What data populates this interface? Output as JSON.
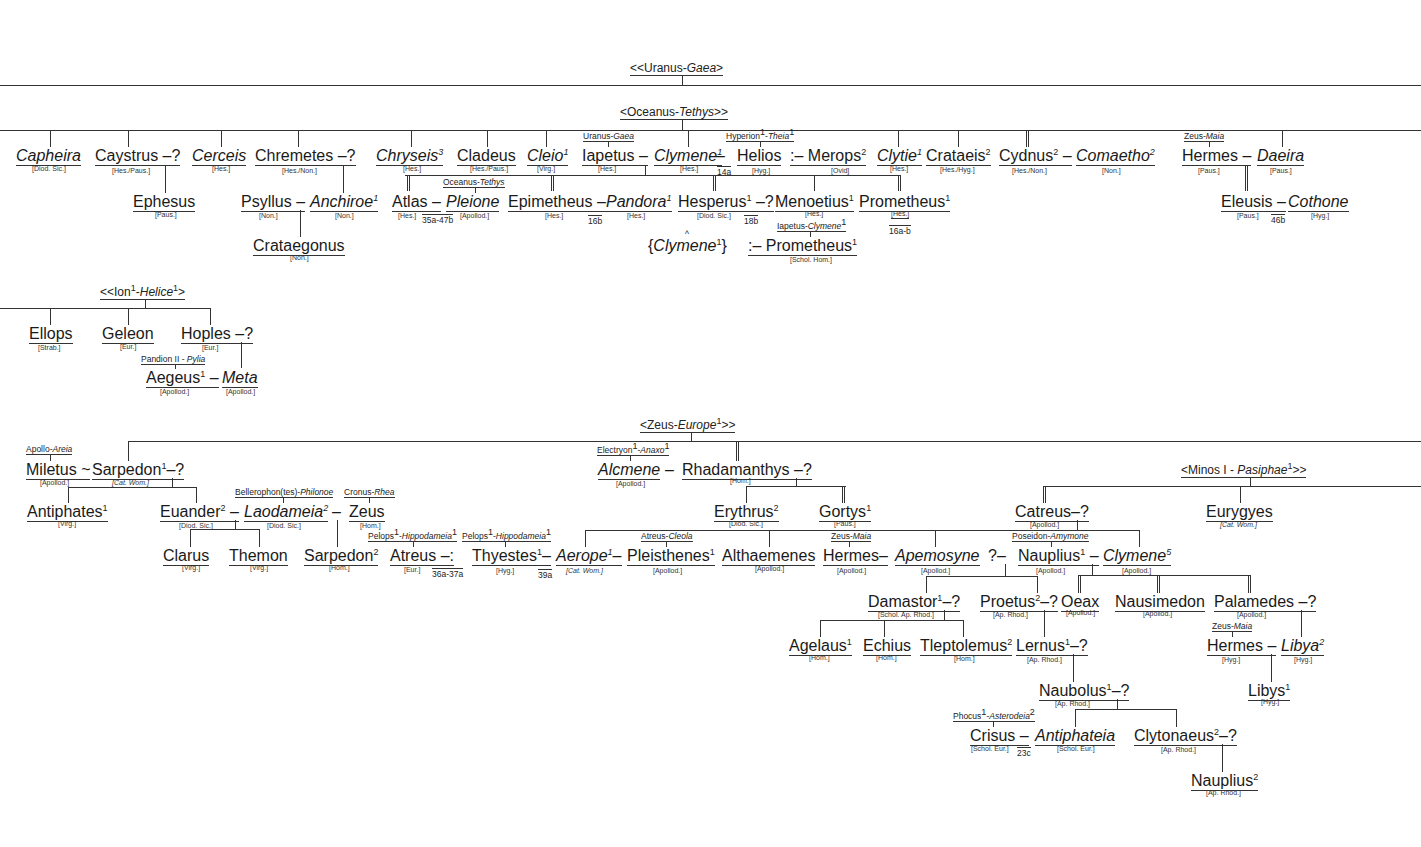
{
  "headers": {
    "uranus": {
      "pre": "<<Uranus-",
      "it": "Gaea",
      "post": ">"
    },
    "oceanus": {
      "pre": "<Oceanus-",
      "it": "Tethys",
      "post": ">>"
    },
    "ion": {
      "pre": "<<Ion",
      "sup1": "1",
      "mid": "-",
      "it": "Helice",
      "sup2": "1",
      "post": ">"
    },
    "zeus": {
      "pre": "<Zeus-",
      "it": "Europe",
      "sup": "1",
      "post": ">>"
    },
    "minos": {
      "pre": "<Minos I - ",
      "it": "Pasiphae",
      "sup": "1",
      "post": ">>"
    }
  },
  "row1": {
    "capheira": {
      "name": "Capheira",
      "src": "[Diod. Sic.]"
    },
    "caystrus": {
      "name": "Caystrus",
      "spouse": "–?",
      "src": "[Hes./Paus.]"
    },
    "cerceis": {
      "name": "Cerceis",
      "src": "[Hes.]"
    },
    "chremetes": {
      "name": "Chremetes",
      "spouse": "–?",
      "src": "[Hes./Non.]"
    },
    "chryseis": {
      "name": "Chryseis",
      "sup": "3",
      "src": "[Hes.]"
    },
    "cladeus": {
      "name": "Cladeus",
      "src": "[Hes./Paus.]"
    },
    "cleio": {
      "name": "Cleio",
      "sup": "1",
      "src": "[Virg.]"
    },
    "iapetus": {
      "parents": "Uranus-",
      "parents_it": "Gaea",
      "name": "Iapetus",
      "dash": "–",
      "src": "[Hes.]"
    },
    "clymene1": {
      "name": "Clymene",
      "sup": "1",
      "dash": "–",
      "src": "[Hes.]",
      "ref": "14a"
    },
    "helios": {
      "parents": "Hyperion",
      "parents_sup": "1",
      "parents_it": "Theia",
      "parents_it_sup": "1",
      "name": "Helios",
      "src": "[Hyg.]"
    },
    "merops": {
      "prefix": ":–",
      "name": "Merops",
      "sup": "2",
      "src": "[Ovid]"
    },
    "clytie": {
      "name": "Clytie",
      "sup": "1",
      "src": "[Hes.]"
    },
    "crataeis": {
      "name": "Crataeis",
      "sup": "2",
      "src": "[Hes./Hyg.]"
    },
    "cydnus": {
      "name": "Cydnus",
      "sup": "2",
      "dash": "–",
      "src": "[Hes./Non.]"
    },
    "comaetho": {
      "name": "Comaetho",
      "sup": "2",
      "src": "[Non.]"
    },
    "hermes": {
      "parents": "Zeus-",
      "parents_it": "Maia",
      "name": "Hermes",
      "dash": "–",
      "src": "[Paus.]"
    },
    "daeira": {
      "name": "Daeira",
      "src": "[Paus.]"
    }
  },
  "row2": {
    "ephesus": {
      "name": "Ephesus",
      "src": "[Paus.]"
    },
    "psyllus": {
      "name": "Psyllus",
      "dash": "–",
      "src": "[Non.]"
    },
    "anchiroe": {
      "name": "Anchiroe",
      "sup": "1",
      "src": "[Non.]"
    },
    "atlas": {
      "name": "Atlas",
      "dash": "–",
      "src": "[Hes.]",
      "ref": "35a-47b"
    },
    "pleione": {
      "parents": "Oceanus-",
      "parents_it": "Tethys",
      "name": "Pleione",
      "src": "[Apollod.]"
    },
    "epimetheus": {
      "name": "Epimetheus",
      "dash": "–",
      "src": "[Hes.]",
      "ref": "16b"
    },
    "pandora": {
      "name": "Pandora",
      "sup": "1",
      "src": "[Hes.]"
    },
    "hesperus": {
      "name": "Hesperus",
      "sup": "1",
      "spouse": "–?",
      "src": "[Diod. Sic.]",
      "ref": "18b"
    },
    "menoetius": {
      "name": "Menoetius",
      "sup": "1",
      "src": "[Hes.]"
    },
    "prometheus": {
      "name": "Prometheus",
      "sup": "1",
      "src": "[Hes.]",
      "ref": "16a-b"
    },
    "eleusis": {
      "name": "Eleusis",
      "dash": "–",
      "src": "[Paus.]",
      "ref": "46b"
    },
    "cothone": {
      "name": "Cothone",
      "src": "[Hyg.]"
    }
  },
  "row3": {
    "crataegonus": {
      "name": "Crataegonus",
      "src": "[Non.]"
    },
    "clymene_alt": {
      "open": "{",
      "name": "Clymene",
      "sup": "1",
      "close": "}",
      "caret": "^"
    },
    "prometheus_alt": {
      "parents": "Iapetus-",
      "parents_it": "Clymene",
      "parents_it_sup": "1",
      "prefix": ":–",
      "name": "Prometheus",
      "sup": "1",
      "src": "[Schol. Hom.]"
    }
  },
  "ion_family": {
    "ellops": {
      "name": "Ellops",
      "src": "[Strab.]"
    },
    "geleon": {
      "name": "Geleon",
      "src": "[Eur.]"
    },
    "hoples": {
      "name": "Hoples",
      "spouse": "–?",
      "src": "[Eur.]"
    },
    "aegeus": {
      "parents": "Pandion II - ",
      "parents_it": "Pylia",
      "name": "Aegeus",
      "sup": "1",
      "dash": "–",
      "src": "[Apollod.]"
    },
    "meta": {
      "name": "Meta",
      "src": "[Apollod.]"
    }
  },
  "zeus_family": {
    "miletus": {
      "parents": "Apollo-",
      "parents_it": "Areia",
      "name": "Miletus",
      "tilde": "~",
      "src": "[Apollod.]"
    },
    "sarpedon1": {
      "name": "Sarpedon",
      "sup": "1",
      "spouse": "–?",
      "src": "[Cat. Wom.]"
    },
    "antiphates": {
      "name": "Antiphates",
      "sup": "1",
      "src": "[Virg.]"
    },
    "euander": {
      "name": "Euander",
      "sup": "2",
      "dash": "–",
      "src": "[Diod. Sic.]"
    },
    "laodameia": {
      "parents": "Bellerophon(tes)-",
      "parents_it": "Philonoe",
      "name": "Laodameia",
      "sup": "2",
      "dash": "–",
      "src": "[Diod. Sic.]"
    },
    "zeus": {
      "parents": "Cronus-",
      "parents_it": "Rhea",
      "name": "Zeus",
      "src": "[Hom.]"
    },
    "clarus": {
      "name": "Clarus",
      "src": "[Virg.]"
    },
    "themon": {
      "name": "Themon",
      "src": "[Virg.]"
    },
    "sarpedon2": {
      "name": "Sarpedon",
      "sup": "2",
      "src": "[Hom.]"
    },
    "atreus": {
      "parents": "Pelops",
      "parents_sup": "1",
      "parents_it": "Hippodameia",
      "parents_it_sup": "1",
      "name": "Atreus",
      "spouse": "–:",
      "src": "[Eur.]",
      "ref": "36a-37a"
    },
    "thyestes": {
      "parents": "Pelops",
      "parents_sup": "1",
      "parents_it": "Hippodameia",
      "parents_it_sup": "1",
      "name": "Thyestes",
      "sup": "1",
      "dash": "–",
      "src": "[Hyg.]",
      "ref": "39a"
    },
    "aerope": {
      "name": "Aerope",
      "sup": "1",
      "dash": "–",
      "src": "[Cat. Wom.]"
    },
    "pleisthenes": {
      "parents": "Atreus-",
      "parents_it": "Cleola",
      "name": "Pleisthenes",
      "sup": "1",
      "src": "[Apollod.]"
    },
    "alcmene": {
      "parents": "Electryon",
      "parents_sup": "1",
      "parents_it": "Anaxo",
      "parents_it_sup": "1",
      "name": "Alcmene",
      "dash": "–",
      "src": "[Apollod.]"
    },
    "rhadamanthys": {
      "name": "Rhadamanthys",
      "spouse": "–?",
      "src": "[Hom.]"
    },
    "erythrus": {
      "name": "Erythrus",
      "sup": "2",
      "src": "[Diod. Sic.]"
    },
    "gortys": {
      "name": "Gortys",
      "sup": "1",
      "src": "[Paus.]"
    },
    "althaemenes": {
      "name": "Althaemenes",
      "src": "[Apollod.]"
    },
    "hermes2": {
      "parents": "Zeus-",
      "parents_it": "Maia",
      "name": "Hermes",
      "dash": "–",
      "src": "[Apollod.]"
    },
    "apemosyne": {
      "name": "Apemosyne",
      "src": "[Apollod.]"
    }
  },
  "minos_family": {
    "catreus": {
      "name": "Catreus",
      "spouse": "–?",
      "src": "[Apollod.]"
    },
    "eurygyes": {
      "name": "Eurygyes",
      "src": "[Cat. Wom.]"
    },
    "nauplius1": {
      "prefix": "?–",
      "parents": "Poseidon-",
      "parents_it": "Amymone",
      "name": "Nauplius",
      "sup": "1",
      "dash": "–",
      "src": "[Apollod.]"
    },
    "clymene5": {
      "name": "Clymene",
      "sup": "5",
      "src": "[Apollod.]"
    },
    "damastor": {
      "name": "Damastor",
      "sup": "1",
      "spouse": "–?",
      "src": "[Schol. Ap. Rhod.]"
    },
    "proetus": {
      "name": "Proetus",
      "sup": "2",
      "spouse": "–?",
      "src": "[Ap. Rhod.]"
    },
    "oeax": {
      "name": "Oeax",
      "src": "[Apollod.]"
    },
    "nausimedon": {
      "name": "Nausimedon",
      "src": "[Apollod.]"
    },
    "palamedes": {
      "name": "Palamedes",
      "spouse": "–?",
      "src": "[Apollod.]"
    },
    "agelaus": {
      "name": "Agelaus",
      "sup": "1",
      "src": "[Hom.]"
    },
    "echius": {
      "name": "Echius",
      "src": "[Hom.]"
    },
    "tleptolemus": {
      "name": "Tleptolemus",
      "sup": "2",
      "src": "[Hom.]"
    },
    "lernus": {
      "name": "Lernus",
      "sup": "1",
      "spouse": "–?",
      "src": "[Ap. Rhod.]"
    },
    "hermes3": {
      "parents": "Zeus-",
      "parents_it": "Maia",
      "name": "Hermes",
      "dash": "–",
      "src": "[Hyg.]"
    },
    "libya": {
      "name": "Libya",
      "sup": "2",
      "src": "[Hyg.]"
    },
    "libys": {
      "name": "Libys",
      "sup": "1",
      "src": "[Hyg.]"
    },
    "naubolus": {
      "name": "Naubolus",
      "sup": "1",
      "spouse": "–?",
      "src": "[Ap. Rhod.]"
    },
    "crisus": {
      "parents": "Phocus",
      "parents_sup": "1",
      "parents_it": "Asterodeia",
      "parents_it_sup": "2",
      "name": "Crisus",
      "dash": "–",
      "src": "[Schol. Eur.]",
      "ref": "23c"
    },
    "antiphateia": {
      "name": "Antiphateia",
      "src": "[Schol. Eur.]"
    },
    "clytonaeus": {
      "name": "Clytonaeus",
      "sup": "2",
      "spouse": "–?",
      "src": "[Ap. Rhod.]"
    },
    "nauplius2": {
      "name": "Nauplius",
      "sup": "2",
      "src": "[Ap. Rhod.]"
    }
  }
}
